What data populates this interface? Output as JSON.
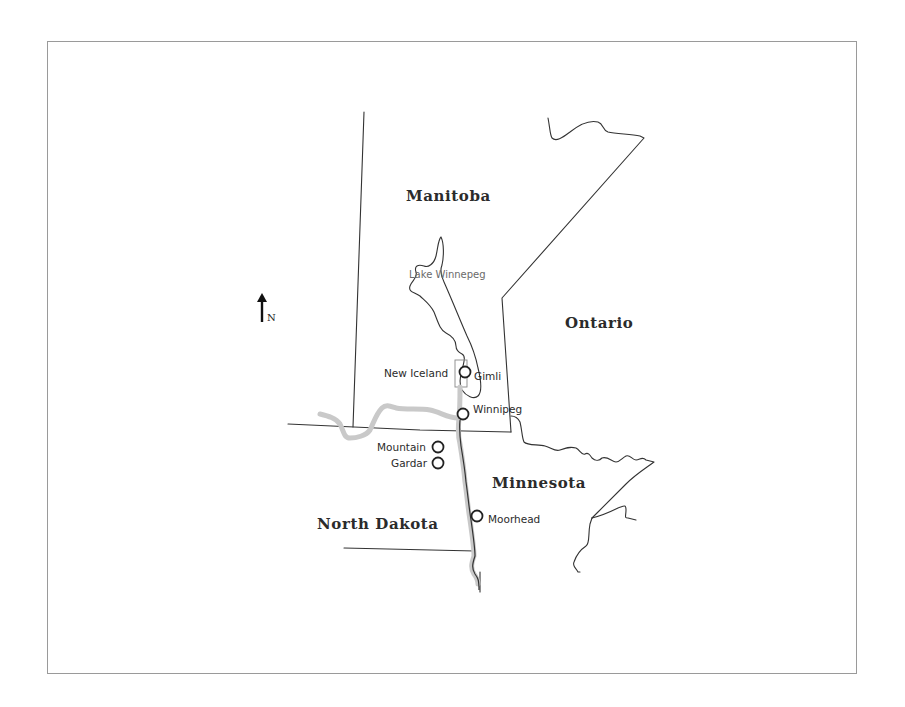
{
  "map": {
    "north_indicator": {
      "icon": "north-arrow-icon",
      "label": "N"
    },
    "regions": [
      {
        "id": "manitoba",
        "label": "Manitoba"
      },
      {
        "id": "ontario",
        "label": "Ontario"
      },
      {
        "id": "minnesota",
        "label": "Minnesota"
      },
      {
        "id": "north-dakota",
        "label": "North Dakota"
      }
    ],
    "water_bodies": [
      {
        "id": "lake-winnipeg",
        "label": "Lake Winnepeg"
      }
    ],
    "areas": [
      {
        "id": "new-iceland",
        "label": "New Iceland"
      }
    ],
    "cities": [
      {
        "id": "gimli",
        "label": "Gimli"
      },
      {
        "id": "winnipeg",
        "label": "Winnipeg"
      },
      {
        "id": "mountain",
        "label": "Mountain"
      },
      {
        "id": "gardar",
        "label": "Gardar"
      },
      {
        "id": "moorhead",
        "label": "Moorhead"
      }
    ],
    "colors": {
      "border": "#333333",
      "route": "#c9c9c9",
      "frame": "#9a9a9a",
      "background": "#ffffff"
    }
  }
}
